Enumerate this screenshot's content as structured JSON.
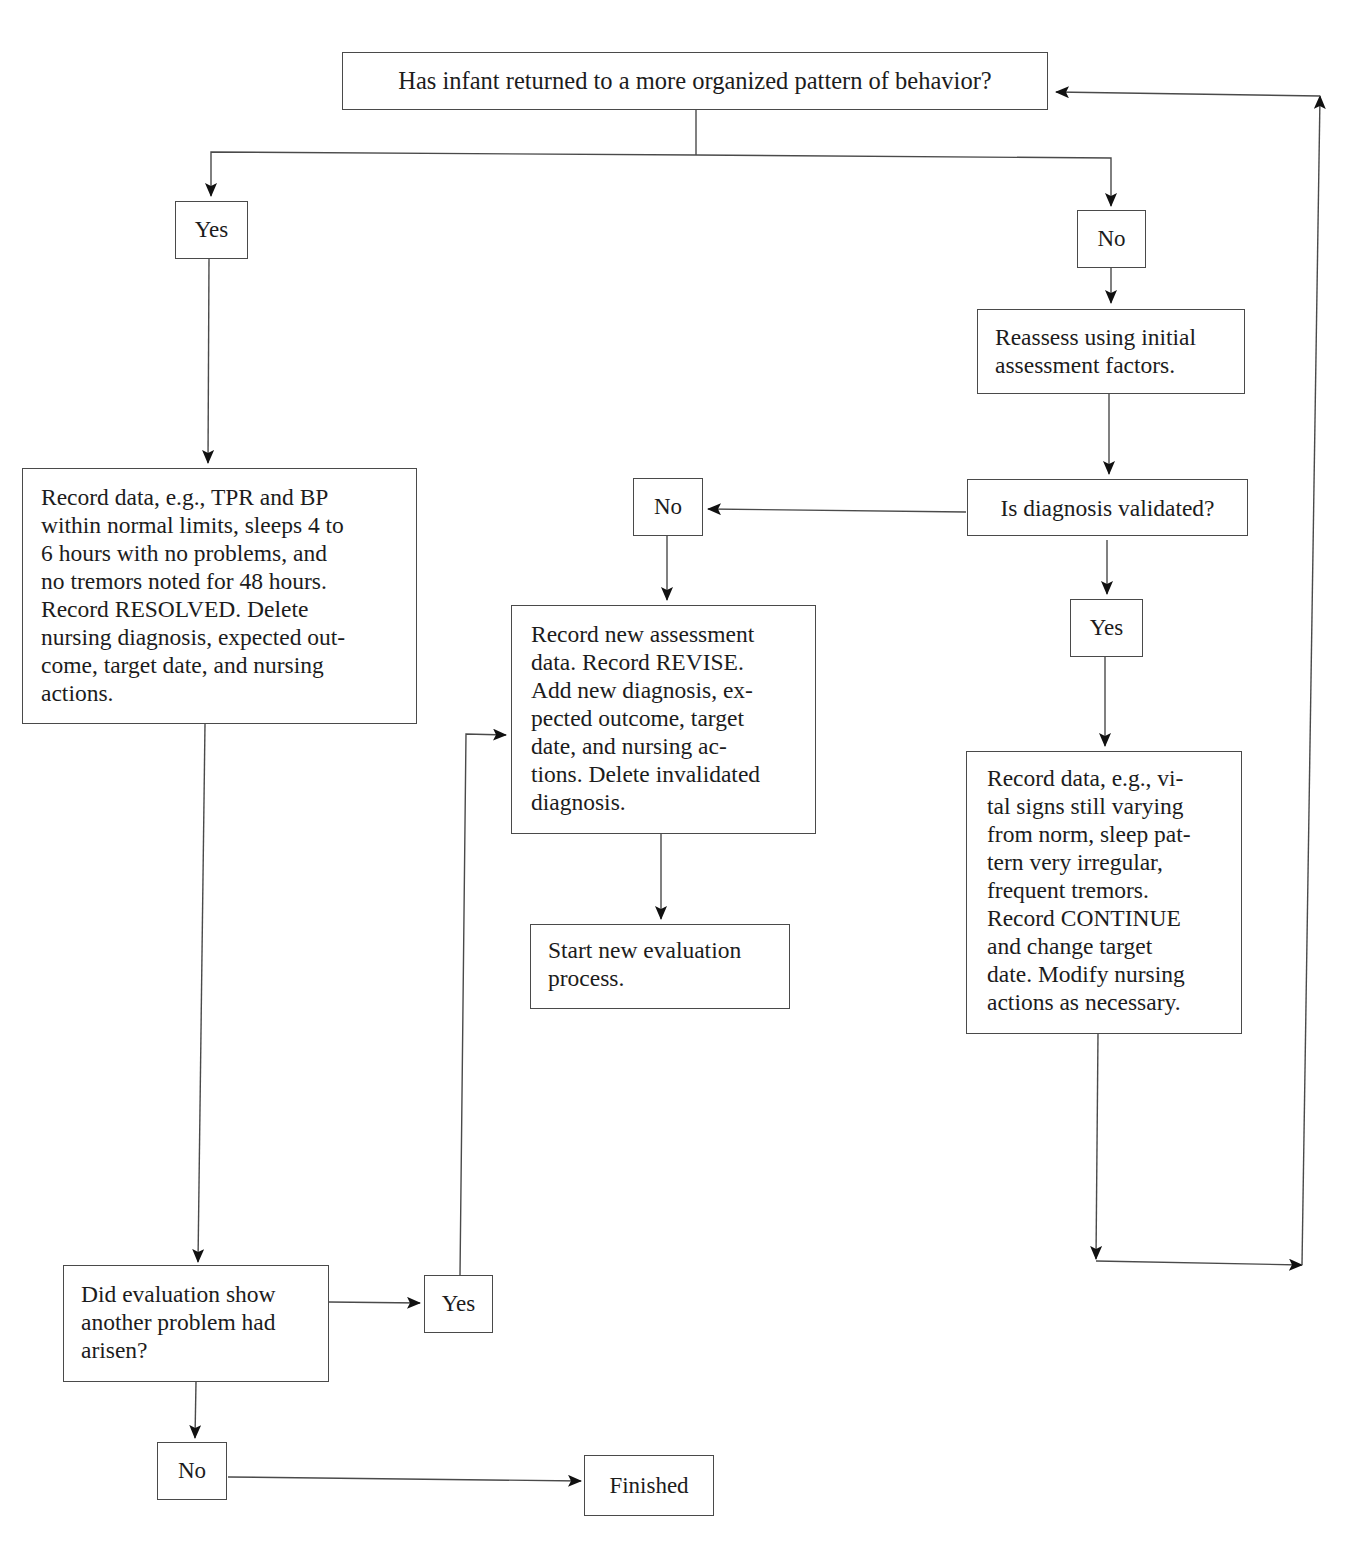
{
  "page": {
    "cutoff_heading": "Evaluation of Expected Outcome"
  },
  "flowchart": {
    "start_question": "Has infant returned to a more organized pattern of behavior?",
    "left_branch": {
      "yes_label": "Yes",
      "resolved_action": "Record data, e.g., TPR and BP\nwithin normal limits, sleeps 4 to\n6 hours with no problems, and\nno tremors noted for 48 hours.\nRecord RESOLVED. Delete\nnursing diagnosis, expected out-\ncome, target date, and nursing\nactions.",
      "followup_question": "Did evaluation show\nanother problem had\narisen?",
      "followup_yes_label": "Yes",
      "followup_no_label": "No",
      "finished_label": "Finished"
    },
    "right_branch": {
      "no_label": "No",
      "reassess_action": "Reassess using initial\nassessment factors.",
      "validation_question": "Is diagnosis validated?",
      "validated_no_label": "No",
      "validated_yes_label": "Yes",
      "revise_action": "Record new assessment\ndata. Record REVISE.\nAdd new diagnosis, ex-\npected outcome, target\ndate, and nursing ac-\ntions. Delete invalidated\ndiagnosis.",
      "new_evaluation_action": "Start new evaluation\nprocess.",
      "continue_action": "Record data, e.g., vi-\ntal signs still varying\nfrom norm, sleep pat-\ntern very irregular,\nfrequent tremors.\nRecord CONTINUE\nand change target\ndate. Modify nursing\nactions as necessary."
    }
  },
  "colors": {
    "line": "#4a4a4a",
    "arrowhead": "#111111",
    "text": "#1c1c1c",
    "background": "#ffffff"
  }
}
